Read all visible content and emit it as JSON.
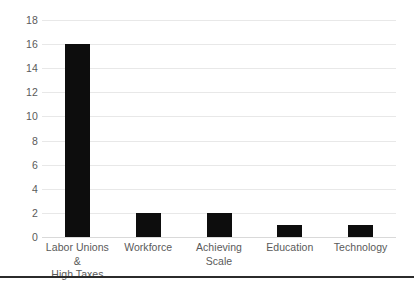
{
  "chart_data": {
    "type": "bar",
    "title": "",
    "subtitle": "",
    "xlabel": "",
    "ylabel": "",
    "categories": [
      "Labor Unions & High Taxes",
      "Workforce",
      "Achieving Scale",
      "Education",
      "Technology"
    ],
    "category_lines": [
      [
        "Labor Unions &",
        "High Taxes"
      ],
      [
        "Workforce"
      ],
      [
        "Achieving Scale"
      ],
      [
        "Education"
      ],
      [
        "Technology"
      ]
    ],
    "values": [
      16,
      2,
      2,
      1,
      1
    ],
    "ylim": [
      0,
      18
    ],
    "ytick_step": 2,
    "ytick_labels": [
      "0",
      "2",
      "4",
      "6",
      "8",
      "10",
      "12",
      "14",
      "16",
      "18"
    ],
    "ytick_values": [
      0,
      2,
      4,
      6,
      8,
      10,
      12,
      14,
      16,
      18
    ],
    "grid": true,
    "grid_axis": "y",
    "legend": false,
    "legend_position": "none",
    "orientation": "vertical",
    "bar_color": "#0d0d0d",
    "gridline_color": "#e8e8e8",
    "axis_label_color": "#5a5a5a",
    "background_color": "#ffffff",
    "annotations": []
  },
  "figure": {
    "bottom_rule_color": "#2b2b2b"
  }
}
